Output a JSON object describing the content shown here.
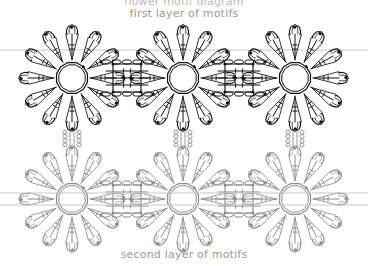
{
  "page": {
    "width": 368,
    "height": 266,
    "background": "#ffffff"
  },
  "captions": {
    "clipped_top": "flower motif diagram",
    "top": "first layer of motifs",
    "bottom": "second layer of motifs",
    "color": "#9a9a9a"
  },
  "colors": {
    "first_layer_stroke": "#111111",
    "second_layer_stroke": "#8c8c8c",
    "guide_line": "#c8c8c8",
    "knot_dot": "#000000",
    "background": "#ffffff"
  },
  "diagram": {
    "type": "crochet-chart",
    "layers": [
      {
        "name": "first layer of motifs",
        "stroke": "#111111",
        "row_center_y": 78,
        "motif_centers_x": [
          72,
          183,
          295
        ]
      },
      {
        "name": "second layer of motifs",
        "stroke": "#8c8c8c",
        "row_center_y": 199,
        "motif_centers_x": [
          72,
          183,
          295
        ]
      }
    ],
    "motif": {
      "petal_count": 12,
      "ring_radius": 16,
      "petal_outer_radius": 52,
      "spoke_radius_inner": 18,
      "spoke_radius_outer": 44
    },
    "joiner": {
      "label": "square joining block",
      "count_per_row": 2,
      "centers_x": [
        127,
        239
      ],
      "half_size": 14
    },
    "guide_lines": [
      {
        "y": 50,
        "color": "#c8c8c8"
      },
      {
        "y": 193,
        "color": "#c8c8c8"
      },
      {
        "y": 205,
        "color": "#c8c8c8"
      }
    ]
  }
}
